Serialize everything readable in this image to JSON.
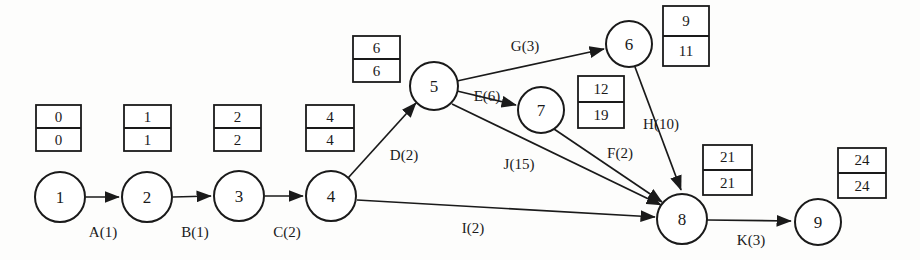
{
  "diagram": {
    "type": "activity-on-arrow-network",
    "title": "",
    "nodes": [
      {
        "id": "1",
        "label": "1",
        "cx": 60,
        "cy": 197,
        "r": 25
      },
      {
        "id": "2",
        "label": "2",
        "cx": 147,
        "cy": 197,
        "r": 25
      },
      {
        "id": "3",
        "label": "3",
        "cx": 239,
        "cy": 196,
        "r": 25
      },
      {
        "id": "4",
        "label": "4",
        "cx": 331,
        "cy": 196,
        "r": 25
      },
      {
        "id": "5",
        "label": "5",
        "cx": 434,
        "cy": 86,
        "r": 24
      },
      {
        "id": "6",
        "label": "6",
        "cx": 629,
        "cy": 44,
        "r": 23
      },
      {
        "id": "7",
        "label": "7",
        "cx": 541,
        "cy": 110,
        "r": 23
      },
      {
        "id": "8",
        "label": "8",
        "cx": 682,
        "cy": 219,
        "r": 25
      },
      {
        "id": "9",
        "label": "9",
        "cx": 818,
        "cy": 222,
        "r": 23
      }
    ],
    "edges": [
      {
        "id": "A",
        "label": "A(1)",
        "from": "1",
        "to": "2",
        "duration": 1,
        "label_x": 103,
        "label_y": 232
      },
      {
        "id": "B",
        "label": "B(1)",
        "from": "2",
        "to": "3",
        "duration": 1,
        "label_x": 195,
        "label_y": 232
      },
      {
        "id": "C",
        "label": "C(2)",
        "from": "3",
        "to": "4",
        "duration": 2,
        "label_x": 287,
        "label_y": 232
      },
      {
        "id": "D",
        "label": "D(2)",
        "from": "4",
        "to": "5",
        "duration": 2,
        "label_x": 404,
        "label_y": 155
      },
      {
        "id": "E",
        "label": "E(6)",
        "from": "5",
        "to": "7",
        "duration": 6,
        "label_x": 487,
        "label_y": 96
      },
      {
        "id": "G",
        "label": "G(3)",
        "from": "5",
        "to": "6",
        "duration": 3,
        "label_x": 525,
        "label_y": 46
      },
      {
        "id": "J",
        "label": "J(15)",
        "from": "5",
        "to": "8",
        "duration": 15,
        "label_x": 519,
        "label_y": 164
      },
      {
        "id": "F",
        "label": "F(2)",
        "from": "7",
        "to": "8",
        "duration": 2,
        "label_x": 620,
        "label_y": 153
      },
      {
        "id": "H",
        "label": "H(10)",
        "from": "6",
        "to": "8",
        "duration": 10,
        "label_x": 661,
        "label_y": 124
      },
      {
        "id": "I",
        "label": "I(2)",
        "from": "4",
        "to": "8",
        "duration": 2,
        "label_x": 473,
        "label_y": 228
      },
      {
        "id": "K",
        "label": "K(3)",
        "from": "8",
        "to": "9",
        "duration": 3,
        "label_x": 751,
        "label_y": 240
      }
    ],
    "time_boxes": [
      {
        "node": "1",
        "earliest": "0",
        "latest": "0",
        "x": 36,
        "y": 105,
        "w": 45,
        "h": 46
      },
      {
        "node": "2",
        "earliest": "1",
        "latest": "1",
        "x": 124,
        "y": 105,
        "w": 47,
        "h": 46
      },
      {
        "node": "3",
        "earliest": "2",
        "latest": "2",
        "x": 214,
        "y": 105,
        "w": 47,
        "h": 46
      },
      {
        "node": "4",
        "earliest": "4",
        "latest": "4",
        "x": 306,
        "y": 105,
        "w": 48,
        "h": 46
      },
      {
        "node": "5",
        "earliest": "6",
        "latest": "6",
        "x": 353,
        "y": 36,
        "w": 47,
        "h": 46
      },
      {
        "node": "6",
        "earliest": "9",
        "latest": "11",
        "x": 663,
        "y": 6,
        "w": 46,
        "h": 60
      },
      {
        "node": "7",
        "earliest": "12",
        "latest": "19",
        "x": 578,
        "y": 76,
        "w": 46,
        "h": 52
      },
      {
        "node": "8",
        "earliest": "21",
        "latest": "21",
        "x": 703,
        "y": 145,
        "w": 49,
        "h": 50
      },
      {
        "node": "9",
        "earliest": "24",
        "latest": "24",
        "x": 838,
        "y": 148,
        "w": 48,
        "h": 50
      }
    ],
    "colors": {
      "stroke": "#1a1a1a",
      "fill": "#ffffff",
      "background": "#fdfdfc"
    }
  }
}
